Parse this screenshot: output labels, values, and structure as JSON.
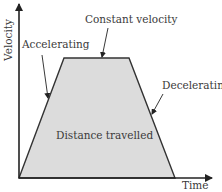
{
  "diagram": {
    "axes": {
      "y_label": "Velocity",
      "x_label": "Time"
    },
    "labels": {
      "accelerating": "Accelerating",
      "constant_velocity": "Constant velocity",
      "decelerating": "Decelerating",
      "area": "Distance travelled"
    },
    "colors": {
      "fill": "#dcdcdc",
      "line": "#333333",
      "text": "#3a3a3a",
      "background": "#ffffff"
    },
    "shape": {
      "type": "trapezoid",
      "points": [
        [
          19,
          178
        ],
        [
          64,
          58
        ],
        [
          129,
          58
        ],
        [
          175,
          178
        ]
      ]
    }
  }
}
